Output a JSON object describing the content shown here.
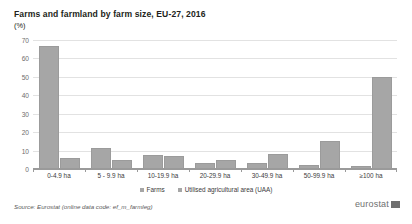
{
  "chart_data": {
    "type": "bar",
    "title": "Farms and farmland by farm size, EU-27, 2016",
    "subtitle": "(%)",
    "xlabel": "",
    "ylabel": "",
    "ylim": [
      0,
      70
    ],
    "yticks": [
      0,
      10,
      20,
      30,
      40,
      50,
      60,
      70
    ],
    "grid": true,
    "legend_position": "bottom",
    "categories": [
      "0-4.9 ha",
      "5 - 9.9 ha",
      "10-19.9 ha",
      "20-29.9 ha",
      "30-49.9 ha",
      "50-99.9 ha",
      "≥100 ha"
    ],
    "series": [
      {
        "name": "Farms",
        "values": [
          66.5,
          11.5,
          7.5,
          3.0,
          3.0,
          2.0,
          1.5
        ]
      },
      {
        "name": "Utilised agricultural area (UAA)",
        "values": [
          6.0,
          5.0,
          7.0,
          5.0,
          8.0,
          15.0,
          50.0
        ]
      }
    ],
    "colors": {
      "farms": "#a6a6a6",
      "uaa": "#a6a6a6",
      "grid": "#e2e2e2",
      "axis": "#9a9a9a"
    }
  },
  "source": {
    "note": "Source: Eurostat (online data code: ef_m_farmleg)"
  },
  "brand": {
    "name": "eurostat"
  }
}
